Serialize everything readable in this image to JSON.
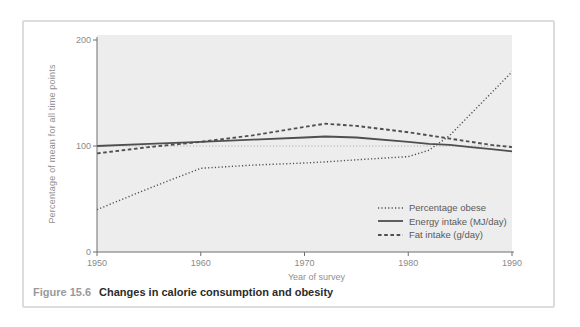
{
  "figure": {
    "caption_label": "Figure 15.6",
    "caption_text": "Changes in calorie consumption and obesity"
  },
  "chart_data": {
    "type": "line",
    "title": "",
    "xlabel": "Year of survey",
    "ylabel": "Percentage of mean for all time points",
    "xlim": [
      1950,
      1990
    ],
    "ylim": [
      0,
      200
    ],
    "x_ticks": [
      1950,
      1960,
      1970,
      1980,
      1990
    ],
    "y_ticks": [
      0,
      100,
      200
    ],
    "grid": false,
    "reference_line_y": 100,
    "legend_position": "inside-lower-right",
    "x": [
      1950,
      1955,
      1960,
      1965,
      1970,
      1972,
      1975,
      1980,
      1982,
      1984,
      1986,
      1988,
      1990
    ],
    "series": [
      {
        "name": "Percentage obese",
        "style": "dotted",
        "values": [
          40,
          60,
          79,
          82,
          84,
          85,
          87,
          90,
          96,
          110,
          130,
          150,
          170
        ]
      },
      {
        "name": "Energy intake (MJ/day)",
        "style": "solid",
        "values": [
          100,
          102,
          104,
          106,
          108,
          109,
          108,
          104,
          102,
          101,
          99,
          97,
          95
        ]
      },
      {
        "name": "Fat intake (g/day)",
        "style": "dashed",
        "values": [
          93,
          99,
          104,
          110,
          118,
          121,
          119,
          113,
          110,
          107,
          104,
          101,
          99
        ]
      }
    ],
    "colors": {
      "series_line": "#4f4f4f",
      "reference_line": "#9b9b9b",
      "plot_background": "#ededed",
      "axis": "#6f6f6f",
      "tick_label": "#8a8a8a",
      "caption_label": "#9a9a9a",
      "caption_text": "#2b2b2b",
      "border": "#dcdcdc"
    }
  }
}
